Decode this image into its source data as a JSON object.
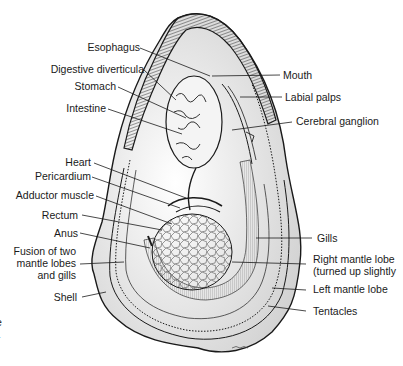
{
  "diagram": {
    "labels_left": [
      {
        "id": "esophagus",
        "text": "Esophagus"
      },
      {
        "id": "digestive-diverticula",
        "text": "Digestive diverticula"
      },
      {
        "id": "stomach",
        "text": "Stomach"
      },
      {
        "id": "intestine",
        "text": "Intestine"
      },
      {
        "id": "heart",
        "text": "Heart"
      },
      {
        "id": "pericardium",
        "text": "Pericardium"
      },
      {
        "id": "adductor-muscle",
        "text": "Adductor muscle"
      },
      {
        "id": "rectum",
        "text": "Rectum"
      },
      {
        "id": "anus",
        "text": "Anus"
      },
      {
        "id": "fusion",
        "text": "Fusion of two\nmantle lobes\nand gills"
      },
      {
        "id": "shell",
        "text": "Shell"
      }
    ],
    "labels_right": [
      {
        "id": "mouth",
        "text": "Mouth"
      },
      {
        "id": "labial-palps",
        "text": "Labial palps"
      },
      {
        "id": "cerebral-ganglion",
        "text": "Cerebral ganglion"
      },
      {
        "id": "gills",
        "text": "Gills"
      },
      {
        "id": "right-mantle-lobe",
        "text": "Right mantle lobe\n(turned up slightly"
      },
      {
        "id": "left-mantle-lobe",
        "text": "Left mantle lobe"
      },
      {
        "id": "tentacles",
        "text": "Tentacles"
      }
    ],
    "edge_fragments": [
      "e",
      "-"
    ],
    "colors": {
      "ink": "#1a1a1a",
      "paper": "#ffffff",
      "shade": "#bdbdbd"
    }
  }
}
